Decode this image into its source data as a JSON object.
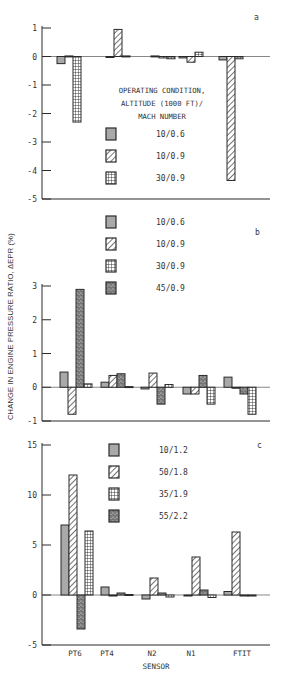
{
  "figure": {
    "ylabel": "CHANGE IN ENGINE PRESSURE RATIO, ΔEPR (%)",
    "xlabel": "SENSOR",
    "legend_title_lines": [
      "OPERATING CONDITION,",
      "ALTITUDE (1000 FT)/",
      "MACH NUMBER"
    ],
    "caption": ""
  },
  "colors": {
    "ink": "#2a2a2a",
    "gray_fill": "#a9a9a9",
    "stipple_fill": "#6e6e6e",
    "background": "#ffffff"
  },
  "chart_data": [
    {
      "type": "bar",
      "panel": "a",
      "title": "",
      "xlabel": "",
      "ylabel": "CHANGE IN ENGINE PRESSURE RATIO, ΔEPR (%)",
      "ylim": [
        -5,
        1
      ],
      "yticks": [
        1,
        0,
        -1,
        -2,
        -3,
        -4,
        -5
      ],
      "grid": false,
      "legend_position": "center",
      "legend_title": "OPERATING CONDITION, ALTITUDE (1000 FT)/ MACH NUMBER",
      "categories": [
        "PT6",
        "PT4",
        "N2",
        "N1",
        "FTIT"
      ],
      "series": [
        {
          "name": "10/0.6",
          "pattern": "gray",
          "values": [
            -0.25,
            0.0,
            0.02,
            -0.05,
            -0.12
          ]
        },
        {
          "name": "10/0.9",
          "pattern": "hatch",
          "values": [
            0.02,
            0.95,
            -0.05,
            -0.2,
            -4.35
          ]
        },
        {
          "name": "30/0.9",
          "pattern": "grid",
          "values": [
            -2.3,
            0.02,
            -0.08,
            0.15,
            -0.08
          ]
        }
      ]
    },
    {
      "type": "bar",
      "panel": "b",
      "title": "",
      "xlabel": "",
      "ylabel": "CHANGE IN ENGINE PRESSURE RATIO, ΔEPR (%)",
      "ylim": [
        -1,
        3
      ],
      "yticks": [
        3,
        2,
        1,
        0,
        -1
      ],
      "grid": false,
      "legend_position": "top",
      "categories": [
        "PT6",
        "PT4",
        "N2",
        "N1",
        "FTIT"
      ],
      "series": [
        {
          "name": "10/0.6",
          "pattern": "gray",
          "values": [
            0.45,
            0.15,
            -0.05,
            -0.2,
            0.3
          ]
        },
        {
          "name": "10/0.9",
          "pattern": "hatch",
          "values": [
            -0.8,
            0.35,
            0.42,
            -0.2,
            0.0
          ]
        },
        {
          "name": "45/0.9",
          "pattern": "stipple",
          "values": [
            2.9,
            0.4,
            -0.5,
            0.35,
            -0.2
          ]
        },
        {
          "name": "30/0.9",
          "pattern": "grid",
          "values": [
            0.1,
            0.02,
            0.08,
            -0.5,
            -0.8
          ]
        }
      ],
      "legend_order": [
        "10/0.6",
        "10/0.9",
        "30/0.9",
        "45/0.9"
      ]
    },
    {
      "type": "bar",
      "panel": "c",
      "title": "",
      "xlabel": "SENSOR",
      "ylabel": "CHANGE IN ENGINE PRESSURE RATIO, ΔEPR (%)",
      "ylim": [
        -5,
        15
      ],
      "yticks": [
        15,
        10,
        5,
        0,
        -5
      ],
      "grid": false,
      "legend_position": "top",
      "categories": [
        "PT6",
        "PT4",
        "N2",
        "N1",
        "FTIT"
      ],
      "series": [
        {
          "name": "10/1.2",
          "pattern": "gray",
          "values": [
            7.0,
            0.8,
            -0.4,
            0.0,
            0.35
          ]
        },
        {
          "name": "50/1.8",
          "pattern": "hatch",
          "values": [
            12.0,
            0.0,
            1.7,
            3.8,
            6.3
          ]
        },
        {
          "name": "55/2.2",
          "pattern": "stipple",
          "values": [
            -3.4,
            0.2,
            0.2,
            0.5,
            0.0
          ]
        },
        {
          "name": "35/1.9",
          "pattern": "grid",
          "values": [
            6.4,
            0.05,
            -0.2,
            -0.25,
            -0.1
          ]
        }
      ],
      "legend_order": [
        "10/1.2",
        "50/1.8",
        "35/1.9",
        "55/2.2"
      ]
    }
  ],
  "layout": {
    "panels": [
      {
        "letter": "a",
        "y_top_val": 1,
        "y_bot_val": -5,
        "px_top": 28,
        "px_bot": 199,
        "axis_x": 42,
        "axis_right": 270,
        "letter_pos": [
          254,
          20
        ],
        "legend_x": 106,
        "legend_y": 118,
        "legend_dy": 22,
        "legend_title_y": [
          93,
          106,
          119
        ],
        "legend_first_y": 128,
        "group_starts": [
          57,
          106,
          151,
          179,
          219
        ],
        "bar_w": 8
      },
      {
        "letter": "b",
        "y_top_val": 3,
        "y_bot_val": -1,
        "px_top": 286,
        "px_bot": 421,
        "axis_x": 42,
        "axis_right": 270,
        "letter_pos": [
          255,
          235
        ],
        "legend_x": 106,
        "legend_first_y": 216,
        "legend_dy": 22,
        "group_starts": [
          60,
          101,
          141,
          183,
          224
        ],
        "bar_w": 8
      },
      {
        "letter": "c",
        "y_top_val": 15,
        "y_bot_val": -5,
        "px_top": 445,
        "px_bot": 645,
        "axis_x": 42,
        "axis_right": 270,
        "letter_pos": [
          257,
          448
        ],
        "legend_x": 109,
        "legend_first_y": 444,
        "legend_dy": 22,
        "group_starts": [
          61,
          101,
          142,
          184,
          224
        ],
        "bar_w": 8
      }
    ],
    "x_tick_centers": [
      75,
      107,
      152,
      191,
      242
    ],
    "x_tick_label_y": 656,
    "xlabel_y": 669
  }
}
